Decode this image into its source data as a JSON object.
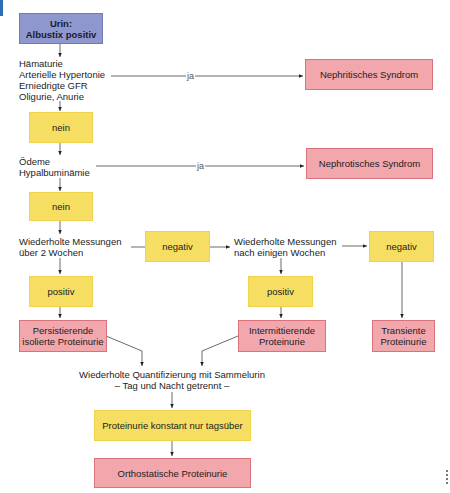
{
  "diagram": {
    "start": {
      "line1": "Urin:",
      "line2": "Albustix positiv"
    },
    "q1": {
      "lines": [
        "Hämaturie",
        "Arterielle Hypertonie",
        "Erniedrigte GFR",
        "Oligurie, Anurie"
      ]
    },
    "q1_yes_label": "ja",
    "q1_yes_result": "Nephritisches Syndrom",
    "q1_no": "nein",
    "q2": {
      "lines": [
        "Ödeme",
        "Hypalbuminämie"
      ]
    },
    "q2_yes_label": "ja",
    "q2_yes_result": "Nephrotisches Syndrom",
    "q2_no": "nein",
    "q3": {
      "lines": [
        "Wiederholte Messungen",
        "über 2 Wochen"
      ]
    },
    "q3_negative": "negativ",
    "q3_positive": "positiv",
    "q3_result": {
      "line1": "Persistierende",
      "line2": "isolierte Proteinurie"
    },
    "q4": {
      "lines": [
        "Wiederholte Messungen",
        "nach einigen Wochen"
      ]
    },
    "q4_negative": "negativ",
    "q4_positive": "positiv",
    "q4_pos_result": {
      "line1": "Intermittierende",
      "line2": "Proteinurie"
    },
    "q4_neg_result": {
      "line1": "Transiente",
      "line2": "Proteinurie"
    },
    "q5": {
      "line1": "Wiederholte Quantifizierung mit Sammelurin",
      "line2": "– Tag und Nacht getrennt –"
    },
    "q5_finding": "Proteinurie konstant nur tagsüber",
    "final_result": "Orthostatische Proteinurie"
  },
  "colors": {
    "start": "#8f97cf",
    "decision": "#f6de62",
    "result": "#f2a7ad",
    "accent": "#2a6fb5"
  }
}
